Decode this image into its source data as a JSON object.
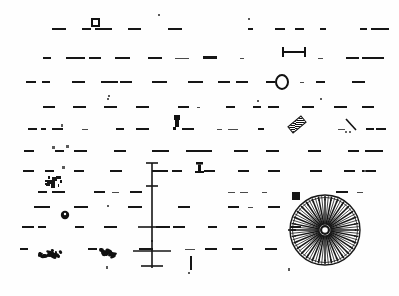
{
  "page": {
    "width": 399,
    "height": 296,
    "background_color": "#fefefe",
    "ink_color": "#161616"
  },
  "colors": {
    "ink": "#161616",
    "ink_light": "#4a4a4a",
    "ink_faint": "#7d7d7d",
    "paper": "#fefefe"
  },
  "text_rows": [
    {
      "id": "row-1",
      "baseline_y": 30,
      "fragments": [
        {
          "x": 52,
          "w": 14,
          "h": 2
        },
        {
          "x": 82,
          "w": 9,
          "h": 2
        },
        {
          "x": 95,
          "w": 17,
          "h": 2
        },
        {
          "x": 128,
          "w": 13,
          "h": 2
        },
        {
          "x": 168,
          "w": 14,
          "h": 2
        },
        {
          "x": 248,
          "w": 5,
          "h": 2
        },
        {
          "x": 275,
          "w": 10,
          "h": 2
        },
        {
          "x": 295,
          "w": 9,
          "h": 2
        },
        {
          "x": 320,
          "w": 6,
          "h": 2
        },
        {
          "x": 360,
          "w": 7,
          "h": 2
        },
        {
          "x": 371,
          "w": 18,
          "h": 2
        }
      ]
    },
    {
      "id": "row-2",
      "baseline_y": 59,
      "fragments": [
        {
          "x": 43,
          "w": 8,
          "h": 2
        },
        {
          "x": 66,
          "w": 19,
          "h": 2
        },
        {
          "x": 89,
          "w": 12,
          "h": 2
        },
        {
          "x": 115,
          "w": 15,
          "h": 2
        },
        {
          "x": 148,
          "w": 14,
          "h": 2
        },
        {
          "x": 175,
          "w": 14,
          "h": 1
        },
        {
          "x": 203,
          "w": 14,
          "h": 3
        },
        {
          "x": 240,
          "w": 4,
          "h": 1
        },
        {
          "x": 318,
          "w": 5,
          "h": 1
        },
        {
          "x": 346,
          "w": 13,
          "h": 2
        },
        {
          "x": 362,
          "w": 22,
          "h": 2
        }
      ]
    },
    {
      "id": "row-3",
      "baseline_y": 83,
      "fragments": [
        {
          "x": 26,
          "w": 10,
          "h": 2
        },
        {
          "x": 42,
          "w": 8,
          "h": 2
        },
        {
          "x": 72,
          "w": 13,
          "h": 2
        },
        {
          "x": 101,
          "w": 17,
          "h": 2
        },
        {
          "x": 120,
          "w": 12,
          "h": 2
        },
        {
          "x": 152,
          "w": 15,
          "h": 2
        },
        {
          "x": 188,
          "w": 15,
          "h": 2
        },
        {
          "x": 218,
          "w": 12,
          "h": 2
        },
        {
          "x": 236,
          "w": 12,
          "h": 2
        },
        {
          "x": 300,
          "w": 4,
          "h": 1
        },
        {
          "x": 316,
          "w": 9,
          "h": 2
        },
        {
          "x": 352,
          "w": 13,
          "h": 2
        }
      ]
    },
    {
      "id": "row-4",
      "baseline_y": 108,
      "fragments": [
        {
          "x": 43,
          "w": 12,
          "h": 2
        },
        {
          "x": 73,
          "w": 13,
          "h": 2
        },
        {
          "x": 104,
          "w": 13,
          "h": 2
        },
        {
          "x": 136,
          "w": 13,
          "h": 2
        },
        {
          "x": 178,
          "w": 11,
          "h": 2
        },
        {
          "x": 197,
          "w": 3,
          "h": 1
        },
        {
          "x": 226,
          "w": 9,
          "h": 2
        },
        {
          "x": 253,
          "w": 8,
          "h": 2
        },
        {
          "x": 268,
          "w": 11,
          "h": 2
        },
        {
          "x": 302,
          "w": 12,
          "h": 2
        },
        {
          "x": 334,
          "w": 13,
          "h": 2
        },
        {
          "x": 362,
          "w": 12,
          "h": 2
        }
      ]
    },
    {
      "id": "row-5",
      "baseline_y": 130,
      "fragments": [
        {
          "x": 28,
          "w": 9,
          "h": 2
        },
        {
          "x": 41,
          "w": 5,
          "h": 2
        },
        {
          "x": 52,
          "w": 11,
          "h": 2
        },
        {
          "x": 82,
          "w": 6,
          "h": 1
        },
        {
          "x": 116,
          "w": 8,
          "h": 2
        },
        {
          "x": 136,
          "w": 13,
          "h": 2
        },
        {
          "x": 182,
          "w": 12,
          "h": 2
        },
        {
          "x": 217,
          "w": 5,
          "h": 1
        },
        {
          "x": 228,
          "w": 10,
          "h": 1
        },
        {
          "x": 258,
          "w": 6,
          "h": 2
        },
        {
          "x": 338,
          "w": 7,
          "h": 1
        },
        {
          "x": 366,
          "w": 8,
          "h": 2
        },
        {
          "x": 376,
          "w": 10,
          "h": 2
        }
      ]
    },
    {
      "id": "row-6",
      "baseline_y": 152,
      "fragments": [
        {
          "x": 24,
          "w": 10,
          "h": 2
        },
        {
          "x": 55,
          "w": 9,
          "h": 2
        },
        {
          "x": 74,
          "w": 13,
          "h": 2
        },
        {
          "x": 114,
          "w": 12,
          "h": 2
        },
        {
          "x": 152,
          "w": 17,
          "h": 2
        },
        {
          "x": 186,
          "w": 26,
          "h": 2
        },
        {
          "x": 234,
          "w": 14,
          "h": 2
        },
        {
          "x": 266,
          "w": 13,
          "h": 2
        },
        {
          "x": 308,
          "w": 13,
          "h": 2
        },
        {
          "x": 348,
          "w": 11,
          "h": 2
        },
        {
          "x": 365,
          "w": 18,
          "h": 2
        }
      ]
    },
    {
      "id": "row-7",
      "baseline_y": 172,
      "fragments": [
        {
          "x": 23,
          "w": 11,
          "h": 2
        },
        {
          "x": 45,
          "w": 9,
          "h": 2
        },
        {
          "x": 74,
          "w": 10,
          "h": 2
        },
        {
          "x": 110,
          "w": 12,
          "h": 2
        },
        {
          "x": 152,
          "w": 16,
          "h": 2
        },
        {
          "x": 172,
          "w": 10,
          "h": 2
        },
        {
          "x": 204,
          "w": 11,
          "h": 2
        },
        {
          "x": 238,
          "w": 11,
          "h": 2
        },
        {
          "x": 268,
          "w": 12,
          "h": 2
        },
        {
          "x": 310,
          "w": 12,
          "h": 2
        },
        {
          "x": 344,
          "w": 11,
          "h": 2
        },
        {
          "x": 362,
          "w": 14,
          "h": 2
        }
      ]
    },
    {
      "id": "row-8",
      "baseline_y": 193,
      "fragments": [
        {
          "x": 38,
          "w": 9,
          "h": 2
        },
        {
          "x": 52,
          "w": 13,
          "h": 2
        },
        {
          "x": 94,
          "w": 11,
          "h": 2
        },
        {
          "x": 112,
          "w": 7,
          "h": 1
        },
        {
          "x": 130,
          "w": 12,
          "h": 2
        },
        {
          "x": 228,
          "w": 7,
          "h": 1
        },
        {
          "x": 240,
          "w": 8,
          "h": 1
        },
        {
          "x": 262,
          "w": 5,
          "h": 1
        },
        {
          "x": 336,
          "w": 12,
          "h": 2
        },
        {
          "x": 357,
          "w": 6,
          "h": 1
        }
      ]
    },
    {
      "id": "row-9",
      "baseline_y": 208,
      "fragments": [
        {
          "x": 34,
          "w": 16,
          "h": 2
        },
        {
          "x": 74,
          "w": 14,
          "h": 2
        },
        {
          "x": 128,
          "w": 14,
          "h": 2
        },
        {
          "x": 178,
          "w": 12,
          "h": 2
        },
        {
          "x": 228,
          "w": 11,
          "h": 2
        },
        {
          "x": 248,
          "w": 5,
          "h": 1
        },
        {
          "x": 268,
          "w": 12,
          "h": 2
        }
      ]
    },
    {
      "id": "row-10",
      "baseline_y": 228,
      "fragments": [
        {
          "x": 22,
          "w": 12,
          "h": 2
        },
        {
          "x": 38,
          "w": 8,
          "h": 2
        },
        {
          "x": 75,
          "w": 9,
          "h": 2
        },
        {
          "x": 104,
          "w": 13,
          "h": 2
        },
        {
          "x": 156,
          "w": 14,
          "h": 2
        },
        {
          "x": 173,
          "w": 12,
          "h": 2
        },
        {
          "x": 208,
          "w": 9,
          "h": 2
        },
        {
          "x": 238,
          "w": 9,
          "h": 2
        },
        {
          "x": 256,
          "w": 9,
          "h": 2
        },
        {
          "x": 290,
          "w": 11,
          "h": 2
        }
      ]
    },
    {
      "id": "row-11",
      "baseline_y": 250,
      "fragments": [
        {
          "x": 20,
          "w": 8,
          "h": 2
        },
        {
          "x": 88,
          "w": 9,
          "h": 2
        },
        {
          "x": 139,
          "w": 14,
          "h": 2
        },
        {
          "x": 185,
          "w": 10,
          "h": 1
        },
        {
          "x": 205,
          "w": 12,
          "h": 2
        },
        {
          "x": 232,
          "w": 11,
          "h": 2
        },
        {
          "x": 265,
          "w": 12,
          "h": 2
        }
      ]
    }
  ],
  "figures": [
    {
      "id": "fig-square-marker",
      "name": "square-outline-marker",
      "shape": "square-outline",
      "x": 91,
      "y": 18,
      "w": 9,
      "h": 9
    },
    {
      "id": "fig-dumbbell",
      "name": "dumbbell-marker",
      "shape": "dumbbell",
      "x": 280,
      "y": 46,
      "w": 26,
      "h": 10,
      "note": "horizontal bar with vertical end-caps"
    },
    {
      "id": "fig-circle-lead",
      "name": "circle-outline-with-leader",
      "shape": "circle-outline",
      "x": 278,
      "y": 75,
      "w": 13,
      "h": 14,
      "leader_from_x": 266
    },
    {
      "id": "fig-post",
      "name": "post-marker",
      "shape": "post",
      "x": 172,
      "y": 115,
      "w": 8,
      "h": 13
    },
    {
      "id": "fig-hatched-bar",
      "name": "hatched-diagonal-bar",
      "shape": "hatched-bar",
      "x": 288,
      "y": 120,
      "w": 16,
      "h": 7,
      "rotation_deg": 40
    },
    {
      "id": "fig-chevron",
      "name": "chevron-mark",
      "shape": "chevron",
      "x": 344,
      "y": 118,
      "w": 14,
      "h": 14
    },
    {
      "id": "fig-bracket",
      "name": "bracket-mark",
      "shape": "bracket",
      "x": 194,
      "y": 162,
      "w": 9,
      "h": 10
    },
    {
      "id": "fig-dot-glyph",
      "name": "filled-dot-glyph",
      "shape": "filled-circle",
      "x": 60,
      "y": 210,
      "w": 8,
      "h": 8
    },
    {
      "id": "fig-mast",
      "name": "vertical-mast-with-crossbars",
      "shape": "mast",
      "x": 152,
      "y": 163,
      "h": 105,
      "crossbars": [
        {
          "y": 163,
          "half_w": 6
        },
        {
          "y": 186,
          "half_w": 6
        },
        {
          "y": 227,
          "half_w": 14
        },
        {
          "y": 251,
          "half_w": 19
        },
        {
          "y": 266,
          "half_w": 11
        }
      ]
    },
    {
      "id": "fig-rosette",
      "name": "radial-rosette-wheel",
      "shape": "radial-sunburst",
      "cx": 325,
      "cy": 230,
      "r": 35,
      "spokes": 64,
      "hub_r": 5,
      "note": "dense spoked wheel / sunburst figure, bottom right of page"
    },
    {
      "id": "fig-dark-square",
      "name": "filled-square-marker",
      "shape": "filled-square",
      "x": 292,
      "y": 192,
      "w": 8,
      "h": 8
    },
    {
      "id": "fig-blob-left",
      "name": "ink-blob-cluster-left",
      "shape": "blob-cluster",
      "x": 36,
      "y": 248,
      "w": 30,
      "h": 10
    },
    {
      "id": "fig-blob-mid",
      "name": "ink-blob-cluster-mid",
      "shape": "blob-cluster",
      "x": 98,
      "y": 248,
      "w": 20,
      "h": 10
    },
    {
      "id": "fig-specks",
      "name": "ink-speck-cluster",
      "shape": "speck-cluster",
      "x": 44,
      "y": 175,
      "w": 22,
      "h": 16
    },
    {
      "id": "fig-tick-bottom",
      "name": "short-vertical-tick",
      "shape": "vertical-tick",
      "x": 190,
      "y": 256,
      "w": 2,
      "h": 14
    }
  ],
  "specks": [
    {
      "x": 158,
      "y": 14,
      "w": 2,
      "h": 2
    },
    {
      "x": 248,
      "y": 18,
      "w": 2,
      "h": 2
    },
    {
      "x": 108,
      "y": 95,
      "w": 2,
      "h": 2
    },
    {
      "x": 107,
      "y": 98,
      "w": 2,
      "h": 2
    },
    {
      "x": 320,
      "y": 98,
      "w": 2,
      "h": 2
    },
    {
      "x": 257,
      "y": 100,
      "w": 2,
      "h": 2
    },
    {
      "x": 61,
      "y": 124,
      "w": 2,
      "h": 3
    },
    {
      "x": 52,
      "y": 146,
      "w": 3,
      "h": 3
    },
    {
      "x": 66,
      "y": 145,
      "w": 3,
      "h": 3
    },
    {
      "x": 62,
      "y": 166,
      "w": 3,
      "h": 3
    },
    {
      "x": 107,
      "y": 205,
      "w": 2,
      "h": 2
    },
    {
      "x": 106,
      "y": 266,
      "w": 2,
      "h": 3
    },
    {
      "x": 188,
      "y": 272,
      "w": 2,
      "h": 2
    },
    {
      "x": 288,
      "y": 268,
      "w": 2,
      "h": 3
    },
    {
      "x": 364,
      "y": 170,
      "w": 2,
      "h": 2
    },
    {
      "x": 151,
      "y": 240,
      "w": 2,
      "h": 2
    }
  ]
}
